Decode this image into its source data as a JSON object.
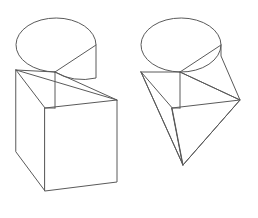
{
  "canvas": {
    "width": 258,
    "height": 218,
    "background_color": "#ffffff",
    "stroke_color": "#5a5a5a",
    "stroke_width": 1
  },
  "figure_set": {
    "title": "",
    "description": "Two line-art 3D geometric solids drawn side by side on a white background: a notched cylinder resting on a rectangular box (left) and a notched cylinder tapering to a wedge point (right).",
    "count": 2
  },
  "figures": [
    {
      "id": "left-figure",
      "name": "notched-cylinder-on-box",
      "label": "",
      "parts": [
        "cylinder-top",
        "wedge-notch",
        "rectangular-box-base"
      ],
      "geometry": {
        "ellipse": {
          "cx": 56,
          "cy": 45,
          "rx": 40,
          "ry": 27
        },
        "notch_apex": [
          55,
          72
        ],
        "box_top_back_left": [
          16,
          70
        ],
        "box_top_front_left": [
          45,
          108
        ],
        "box_top_front_right": [
          117,
          100
        ],
        "box_bottom_left": [
          16,
          152
        ],
        "box_bottom_front_left": [
          45,
          191
        ],
        "box_bottom_front_right": [
          117,
          182
        ]
      }
    },
    {
      "id": "right-figure",
      "name": "notched-cylinder-wedge-point",
      "label": "",
      "parts": [
        "cylinder-top",
        "wedge-notch",
        "tapering-wedge-base"
      ],
      "geometry": {
        "ellipse": {
          "cx": 181,
          "cy": 45,
          "rx": 40,
          "ry": 27
        },
        "notch_apex": [
          180,
          72
        ],
        "left_arc_edge": [
          141,
          72
        ],
        "right_vertex": [
          240,
          100
        ],
        "bottom_apex": [
          183,
          165
        ],
        "inner_front_left": [
          172,
          108
        ],
        "inner_front_right": [
          236,
          99
        ]
      }
    }
  ]
}
